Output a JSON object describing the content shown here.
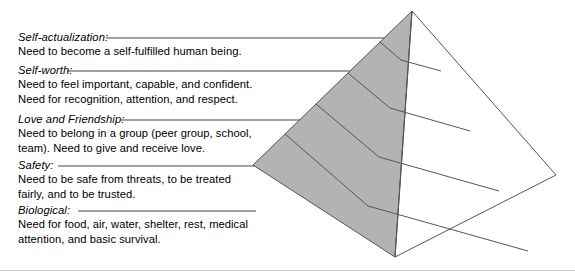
{
  "figure": {
    "colors": {
      "shaded_face": "#b3b3b3",
      "unshaded_face": "#ffffff",
      "outline": "#555555",
      "leader_line": "#444444",
      "text": "#000000",
      "frame": "#c9c9c9"
    }
  },
  "needs": [
    {
      "term": "Self-actualization:",
      "lines": [
        "Need to become a self-fulfilled human being."
      ],
      "leader": {
        "x1": 106,
        "x2": 396,
        "y": 38
      },
      "text_top": 30
    },
    {
      "term": "Self-worth:",
      "lines": [
        "Need to feel important, capable, and confident.",
        "Need for recognition, attention, and respect."
      ],
      "leader": {
        "x1": 67,
        "x2": 378,
        "y": 71
      },
      "text_top": 63
    },
    {
      "term": "Love and Friendship:",
      "lines": [
        "Need to belong in a group (peer group, school,",
        "team). Need to give and receive love."
      ],
      "leader": {
        "x1": 121,
        "x2": 345,
        "y": 120
      },
      "text_top": 112
    },
    {
      "term": "Safety:",
      "lines": [
        "Need to be safe from threats, to be treated",
        "fairly, and to be trusted."
      ],
      "leader": {
        "x1": 58,
        "x2": 300,
        "y": 166
      },
      "text_top": 158
    },
    {
      "term": "Biological:",
      "lines": [
        "Need for food, air, water, shelter, rest, medical",
        "attention, and basic survival."
      ],
      "leader": {
        "x1": 78,
        "x2": 256,
        "y": 211
      },
      "text_top": 203
    }
  ],
  "pyramid": {
    "apex": {
      "x": 412,
      "y": 11
    },
    "left_corner": {
      "x": 253,
      "y": 165
    },
    "front_corner": {
      "x": 395,
      "y": 257
    },
    "right_corner": {
      "x": 556,
      "y": 175
    },
    "tier_count": 5,
    "left_face_fill": "#b3b3b3",
    "right_face_fill": "#ffffff",
    "left_face_points": "412,11 253,165 395,257",
    "right_face_points": "412,11 556,175 395,257",
    "left_divider_lines": [
      "380,42 401,60",
      "348,73 390,108",
      "316,104 379,157",
      "285,134 368,206"
    ],
    "right_divider_lines": [
      "401,60 441,71",
      "390,108 470,131",
      "379,157 499,191",
      "368,206 528,251"
    ],
    "front_edge": "412,11 395,257",
    "left_outline": "412,11 253,165",
    "left_base_edge": "253,165 395,257",
    "right_outline": "412,11 556,175",
    "right_base_edge": "556,175 395,257"
  }
}
